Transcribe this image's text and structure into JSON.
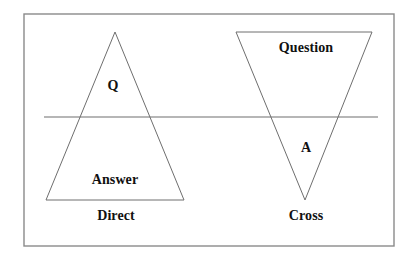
{
  "figure": {
    "background_color": "#ffffff",
    "stroke_color": "#6e6e6e",
    "text_color": "#111111",
    "border": {
      "name": "figure-border",
      "x": 24,
      "y": 14,
      "width": 370,
      "height": 232,
      "color": "#8a8a8a",
      "stroke_width": 1.4
    },
    "divider_line": {
      "name": "horizontal-divider",
      "x1": 44,
      "y1": 117,
      "x2": 378,
      "y2": 117,
      "color": "#6e6e6e",
      "stroke_width": 1.2
    },
    "shapes": [
      {
        "name": "direct-triangle",
        "orientation": "apex-up",
        "points": "115,32 184,200 46,200",
        "color": "#6e6e6e",
        "stroke_width": 1.0
      },
      {
        "name": "cross-triangle",
        "orientation": "apex-down",
        "points": "236,32 372,32 305,200",
        "color": "#6e6e6e",
        "stroke_width": 1.0
      }
    ],
    "labels": {
      "q": "Q",
      "answer": "Answer",
      "direct": "Direct",
      "question": "Question",
      "a": "A",
      "cross": "Cross"
    }
  }
}
